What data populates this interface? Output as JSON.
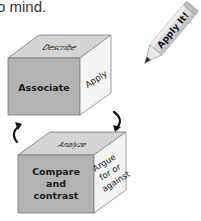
{
  "intro_text": "o mind.",
  "colors": {
    "front_face": "#b3b3b3",
    "top_face": "#d4d4d4",
    "side_face": "#f4f4f4",
    "edge": "#555555",
    "text": "#1a1a1a",
    "arrow": "#111111",
    "pencil_body": "#dcdcdc",
    "pencil_tip": "#333333"
  },
  "cubes": [
    {
      "top": "Describe",
      "front": "Associate",
      "side": "Apply"
    },
    {
      "top": "Analyze",
      "front_lines": [
        "Compare",
        "and",
        "contrast"
      ],
      "side_lines": [
        "Argue",
        "for or",
        "against"
      ]
    }
  ],
  "pencil": {
    "label": "Apply It!"
  },
  "arrows": [
    {
      "name": "rotate-arrow-left"
    },
    {
      "name": "rotate-arrow-right"
    }
  ]
}
